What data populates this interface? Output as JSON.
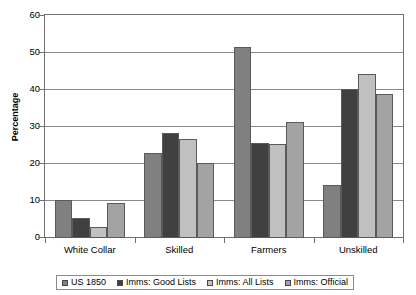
{
  "chart_data": {
    "type": "bar",
    "title": "",
    "xlabel": "",
    "ylabel": "Percentage",
    "ylim": [
      0,
      60
    ],
    "yticks": [
      0,
      10,
      20,
      30,
      40,
      50,
      60
    ],
    "ytick_labels": [
      "0",
      "10",
      "20",
      "30",
      "40",
      "50",
      "60"
    ],
    "grid": true,
    "legend_position": "bottom",
    "categories": [
      "White Collar",
      "Skilled",
      "Farmers",
      "Unskilled"
    ],
    "series": [
      {
        "name": "US 1850",
        "color": "#808080",
        "values": [
          10.3,
          23.0,
          51.5,
          14.3
        ]
      },
      {
        "name": "Imms: Good Lists",
        "color": "#404040",
        "values": [
          5.4,
          28.3,
          25.5,
          40.0
        ]
      },
      {
        "name": "Imms: All Lists",
        "color": "#c0c0c0",
        "values": [
          3.0,
          26.7,
          25.3,
          44.0
        ]
      },
      {
        "name": "Imms: Official",
        "color": "#a3a3a3",
        "values": [
          9.3,
          20.3,
          31.3,
          38.7
        ]
      }
    ]
  }
}
